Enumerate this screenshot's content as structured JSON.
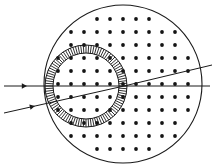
{
  "figure": {
    "type": "optical-ray-diagram",
    "canvas": {
      "width": 216,
      "height": 167,
      "background": "#ffffff"
    },
    "ink_color": "#1a1a1a",
    "dot_color": "#141414"
  },
  "outer_circle": {
    "name": "lens-boundary",
    "center_x": 123,
    "center_y": 84,
    "radius": 79,
    "stroke": "#1a1a1a",
    "stroke_width": 1.1,
    "fill": "none"
  },
  "annulus": {
    "name": "hatched-shell",
    "center_x": 86,
    "center_y": 86,
    "outer_radius": 41,
    "inner_radius": 33,
    "stroke": "#1a1a1a",
    "stroke_width": 1.0,
    "hatch_count": 96,
    "hatch_stroke_width": 0.9,
    "description": "radially hatched annular shell"
  },
  "dot_grid": {
    "name": "index-medium-dots",
    "spacing": 13,
    "origin_x": 123,
    "origin_y": 84,
    "dot_radius": 1.9,
    "clip": "outer_circle",
    "description": "square lattice of dots filling the outer circle"
  },
  "rays": [
    {
      "label": "axial-ray",
      "start_x": 4,
      "start_y": 86,
      "focus_x": 124,
      "focus_y": 86,
      "exit_x": 210,
      "exit_y": 86,
      "arrow_x": 27,
      "arrow_y": 86,
      "stroke_width": 1.0
    },
    {
      "label": "oblique-ray",
      "start_x": 4,
      "start_y": 113,
      "focus_x": 124,
      "focus_y": 86,
      "exit_x": 212,
      "exit_y": 65,
      "arrow_x": 35,
      "arrow_y": 106,
      "stroke_width": 1.0
    }
  ],
  "focal_point": {
    "name": "focus",
    "x": 124,
    "y": 86
  }
}
